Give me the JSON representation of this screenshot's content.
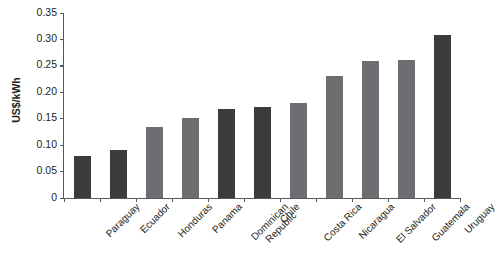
{
  "chart_data": {
    "type": "bar",
    "title": "",
    "xlabel": "",
    "ylabel": "US$/kWh",
    "ylim": [
      0,
      0.35
    ],
    "ytick_labels": [
      "0.35",
      "0.30",
      "0.25",
      "0.20",
      "0.15",
      "0.10",
      "0.05",
      "0"
    ],
    "ytick_values": [
      0.35,
      0.3,
      0.25,
      0.2,
      0.15,
      0.1,
      0.05,
      0
    ],
    "grid": false,
    "legend": null,
    "categories": [
      "Paraguay",
      "Ecuador",
      "Honduras",
      "Panama",
      "Dominican Republic",
      "Chile",
      "Costa Rica",
      "Nicaragua",
      "El Salvador",
      "Guatemala",
      "Uruguay"
    ],
    "values": [
      0.08,
      0.09,
      0.135,
      0.152,
      0.168,
      0.172,
      0.18,
      0.23,
      0.26,
      0.262,
      0.308
    ],
    "bar_colors": [
      "#3b3b3d",
      "#3b3b3d",
      "#6d6e71",
      "#6d6e71",
      "#3b3b3d",
      "#3b3b3d",
      "#6d6e71",
      "#6d6e71",
      "#6d6e71",
      "#6d6e71",
      "#3b3b3d"
    ],
    "axis_color": "#58595b",
    "text_color": "#231f20",
    "background": "#ffffff"
  }
}
